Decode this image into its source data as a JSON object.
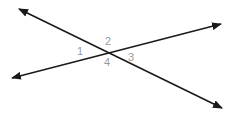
{
  "diagram": {
    "type": "intersecting-lines",
    "line_color": "#1a1a1a",
    "label_color": "#9a9a9a",
    "intersection": {
      "x": 107,
      "y": 53
    },
    "lines": [
      {
        "name": "line-a",
        "from": {
          "x": 19,
          "y": 9
        },
        "to": {
          "x": 222,
          "y": 108
        },
        "arrows": "both"
      },
      {
        "name": "line-b",
        "from": {
          "x": 12,
          "y": 78
        },
        "to": {
          "x": 221,
          "y": 24
        },
        "arrows": "both"
      }
    ],
    "angle_labels": [
      {
        "text": "1",
        "x": 80,
        "y": 55
      },
      {
        "text": "2",
        "x": 108,
        "y": 45
      },
      {
        "text": "3",
        "x": 131,
        "y": 61
      },
      {
        "text": "4",
        "x": 107,
        "y": 66
      }
    ]
  }
}
